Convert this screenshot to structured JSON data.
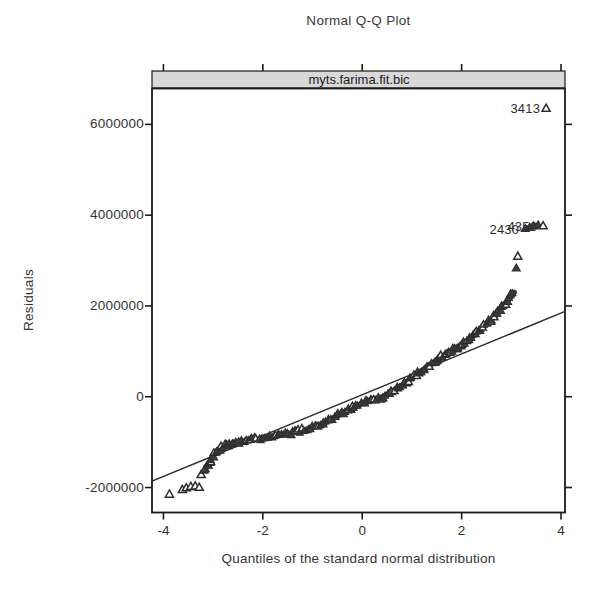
{
  "chart_data": {
    "type": "scatter",
    "title": "Normal Q-Q Plot",
    "panel_label": "myts.farima.fit.bic",
    "xlabel": "Quantiles of the standard normal distribution",
    "ylabel": "Residuals",
    "xlim": [
      -4.23,
      4.08
    ],
    "ylim": [
      -2550000,
      6790000
    ],
    "x_ticks": [
      {
        "v": -4,
        "label": "-4"
      },
      {
        "v": -2,
        "label": "-2"
      },
      {
        "v": 0,
        "label": "0"
      },
      {
        "v": 2,
        "label": "2"
      },
      {
        "v": 4,
        "label": "4"
      }
    ],
    "y_ticks": [
      {
        "v": -2000000,
        "label": "-2000000"
      },
      {
        "v": 0,
        "label": "0"
      },
      {
        "v": 2000000,
        "label": "2000000"
      },
      {
        "v": 4000000,
        "label": "4000000"
      },
      {
        "v": 6000000,
        "label": "6000000"
      }
    ],
    "marker": "triangle",
    "legend": "none",
    "grid": "off",
    "colors": {
      "points": "#3d3d3d",
      "point_outline": "#2e2e2e",
      "reference_line": "#2b2b2b",
      "strip_fill": "#d8d8d8",
      "frame": "#1a1a1a",
      "text": "#2e2e2e"
    },
    "reference_line": {
      "x1": -4.23,
      "y1": -1860000,
      "x2": 4.08,
      "y2": 1880000
    },
    "band": [
      [
        -3.15,
        -1550000
      ],
      [
        -3.05,
        -1400000
      ],
      [
        -2.95,
        -1220000
      ],
      [
        -2.85,
        -1120000
      ],
      [
        -2.7,
        -1050000
      ],
      [
        -2.5,
        -1000000
      ],
      [
        -2.3,
        -960000
      ],
      [
        -2.0,
        -920000
      ],
      [
        -1.7,
        -860000
      ],
      [
        -1.4,
        -790000
      ],
      [
        -1.2,
        -740000
      ],
      [
        -1.0,
        -680000
      ],
      [
        -0.8,
        -600000
      ],
      [
        -0.6,
        -480000
      ],
      [
        -0.4,
        -360000
      ],
      [
        -0.2,
        -250000
      ],
      [
        0.0,
        -150000
      ],
      [
        0.2,
        -60000
      ],
      [
        0.4,
        -10000
      ],
      [
        0.6,
        100000
      ],
      [
        0.8,
        250000
      ],
      [
        1.0,
        420000
      ],
      [
        1.2,
        580000
      ],
      [
        1.4,
        730000
      ],
      [
        1.6,
        880000
      ],
      [
        1.8,
        1020000
      ],
      [
        2.0,
        1160000
      ],
      [
        2.2,
        1300000
      ],
      [
        2.4,
        1500000
      ],
      [
        2.6,
        1720000
      ],
      [
        2.8,
        1950000
      ],
      [
        2.95,
        2150000
      ],
      [
        3.06,
        2300000
      ]
    ],
    "lower_tail_points": [
      {
        "x": -3.88,
        "y": -2150000,
        "style": "open"
      },
      {
        "x": -3.62,
        "y": -2050000,
        "style": "open"
      },
      {
        "x": -3.54,
        "y": -2010000,
        "style": "open"
      },
      {
        "x": -3.45,
        "y": -1980000,
        "style": "open"
      },
      {
        "x": -3.36,
        "y": -1970000,
        "style": "open"
      },
      {
        "x": -3.28,
        "y": -2000000,
        "style": "open"
      },
      {
        "x": -3.24,
        "y": -1720000,
        "style": "open"
      },
      {
        "x": -3.18,
        "y": -1620000,
        "style": "filled"
      }
    ],
    "upper_tail_points": [
      {
        "x": 3.1,
        "y": 2830000,
        "style": "filled"
      },
      {
        "x": 3.13,
        "y": 3090000,
        "style": "open"
      },
      {
        "x": 3.28,
        "y": 3700000,
        "style": "filled"
      },
      {
        "x": 3.37,
        "y": 3730000,
        "style": "filled"
      },
      {
        "x": 3.45,
        "y": 3760000,
        "style": "filled"
      },
      {
        "x": 3.54,
        "y": 3780000,
        "style": "filled"
      },
      {
        "x": 3.64,
        "y": 3760000,
        "style": "open"
      },
      {
        "x": 3.7,
        "y": 6350000,
        "style": "open"
      }
    ],
    "labeled_outliers": [
      {
        "label": "3413",
        "x": 3.7,
        "y": 6350000
      },
      {
        "label": "4356",
        "x": 3.64,
        "y": 3760000
      },
      {
        "label": "2430",
        "x": 3.28,
        "y": 3700000
      }
    ]
  }
}
